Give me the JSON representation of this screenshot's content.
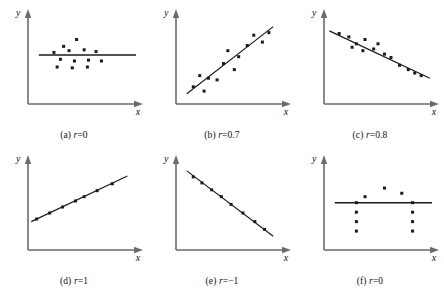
{
  "figure": {
    "title": "",
    "axis_label_x": "x",
    "axis_label_y": "y",
    "axis_color": "#6b6b6b",
    "point_color": "#1a1a1a",
    "line_color": "#1a1a1a"
  },
  "panels": [
    {
      "id": "a",
      "caption": "(a) r=0",
      "label": "(a)",
      "r_symbol": "r",
      "r_value": "=0",
      "xlabel": "x",
      "ylabel": "y"
    },
    {
      "id": "b",
      "caption": "(b) r=0.7",
      "label": "(b)",
      "r_symbol": "r",
      "r_value": "=0.7",
      "xlabel": "x",
      "ylabel": "y"
    },
    {
      "id": "c",
      "caption": "(c) r=0.8",
      "label": "(c)",
      "r_symbol": "r",
      "r_value": "=0.8",
      "xlabel": "x",
      "ylabel": "y"
    },
    {
      "id": "d",
      "caption": "(d) r=1",
      "label": "(d)",
      "r_symbol": "r",
      "r_value": "=1",
      "xlabel": "x",
      "ylabel": "y"
    },
    {
      "id": "e",
      "caption": "(e) r=−1",
      "label": "(e)",
      "r_symbol": "r",
      "r_value": "=−1",
      "xlabel": "x",
      "ylabel": "y"
    },
    {
      "id": "f",
      "caption": "(f) r=0",
      "label": "(f)",
      "r_symbol": "r",
      "r_value": "=0",
      "xlabel": "x",
      "ylabel": "y"
    }
  ],
  "chart_data": [
    {
      "panel": "a",
      "type": "scatter",
      "title": "(a) r=0",
      "xlabel": "x",
      "ylabel": "y",
      "xlim": [
        0,
        100
      ],
      "ylim": [
        0,
        100
      ],
      "grid": false,
      "legend": false,
      "correlation": 0,
      "points": [
        [
          33,
          67
        ],
        [
          45,
          75
        ],
        [
          24,
          60
        ],
        [
          38,
          62
        ],
        [
          52,
          63
        ],
        [
          63,
          61
        ],
        [
          30,
          52
        ],
        [
          43,
          50
        ],
        [
          56,
          51
        ],
        [
          68,
          50
        ],
        [
          27,
          43
        ],
        [
          41,
          42
        ],
        [
          55,
          43
        ]
      ],
      "regression_line": {
        "type": "horizontal",
        "y": 57,
        "x_start": 10,
        "x_end": 100
      }
    },
    {
      "panel": "b",
      "type": "scatter",
      "title": "(b) r=0.7",
      "xlabel": "x",
      "ylabel": "y",
      "xlim": [
        0,
        100
      ],
      "ylim": [
        0,
        100
      ],
      "grid": false,
      "legend": false,
      "correlation": 0.7,
      "points": [
        [
          16,
          20
        ],
        [
          26,
          15
        ],
        [
          30,
          30
        ],
        [
          22,
          33
        ],
        [
          38,
          28
        ],
        [
          44,
          47
        ],
        [
          48,
          62
        ],
        [
          54,
          40
        ],
        [
          58,
          55
        ],
        [
          66,
          68
        ],
        [
          72,
          80
        ],
        [
          80,
          72
        ],
        [
          86,
          83
        ]
      ],
      "regression_line": {
        "type": "linear",
        "x_start": 10,
        "y_start": 12,
        "x_end": 90,
        "y_end": 90
      }
    },
    {
      "panel": "c",
      "type": "scatter",
      "title": "(c) r=0.8",
      "xlabel": "x",
      "ylabel": "y",
      "xlim": [
        0,
        100
      ],
      "ylim": [
        0,
        100
      ],
      "grid": false,
      "legend": false,
      "correlation": 0.8,
      "points": [
        [
          14,
          82
        ],
        [
          23,
          78
        ],
        [
          30,
          70
        ],
        [
          26,
          66
        ],
        [
          38,
          75
        ],
        [
          36,
          62
        ],
        [
          46,
          64
        ],
        [
          50,
          70
        ],
        [
          56,
          58
        ],
        [
          62,
          54
        ],
        [
          70,
          45
        ],
        [
          78,
          40
        ],
        [
          84,
          36
        ],
        [
          90,
          33
        ]
      ],
      "regression_line": {
        "type": "linear",
        "x_start": 5,
        "y_start": 85,
        "x_end": 98,
        "y_end": 30
      }
    },
    {
      "panel": "d",
      "type": "scatter",
      "title": "(d) r=1",
      "xlabel": "x",
      "ylabel": "y",
      "xlim": [
        0,
        100
      ],
      "ylim": [
        0,
        100
      ],
      "grid": false,
      "legend": false,
      "correlation": 1,
      "points": [
        [
          8,
          36
        ],
        [
          20,
          43
        ],
        [
          32,
          50
        ],
        [
          44,
          57
        ],
        [
          52,
          62
        ],
        [
          64,
          69
        ],
        [
          78,
          77
        ]
      ],
      "regression_line": {
        "type": "linear",
        "x_start": 3,
        "y_start": 33,
        "x_end": 92,
        "y_end": 86
      }
    },
    {
      "panel": "e",
      "type": "scatter",
      "title": "(e) r=−1",
      "xlabel": "x",
      "ylabel": "y",
      "xlim": [
        0,
        100
      ],
      "ylim": [
        0,
        100
      ],
      "grid": false,
      "legend": false,
      "correlation": -1,
      "points": [
        [
          16,
          85
        ],
        [
          24,
          78
        ],
        [
          33,
          70
        ],
        [
          42,
          62
        ],
        [
          51,
          53
        ],
        [
          62,
          43
        ],
        [
          73,
          33
        ],
        [
          82,
          24
        ]
      ],
      "regression_line": {
        "type": "linear",
        "x_start": 10,
        "y_start": 92,
        "x_end": 90,
        "y_end": 16
      }
    },
    {
      "panel": "f",
      "type": "scatter",
      "title": "(f) r=0",
      "xlabel": "x",
      "ylabel": "y",
      "xlim": [
        0,
        100
      ],
      "ylim": [
        0,
        100
      ],
      "grid": false,
      "legend": false,
      "correlation": 0,
      "points": [
        [
          38,
          62
        ],
        [
          56,
          72
        ],
        [
          72,
          66
        ],
        [
          30,
          55
        ],
        [
          82,
          55
        ],
        [
          30,
          44
        ],
        [
          82,
          44
        ],
        [
          30,
          33
        ],
        [
          82,
          33
        ],
        [
          30,
          22
        ],
        [
          82,
          22
        ]
      ],
      "regression_line": {
        "type": "horizontal",
        "y": 55,
        "x_start": 10,
        "x_end": 100
      }
    }
  ]
}
